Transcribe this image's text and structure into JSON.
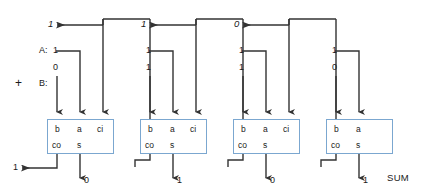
{
  "diagram": {
    "title_label": "SUM",
    "operand_a_label": "A:",
    "operand_b_label": "B:",
    "plus_sign": "+",
    "colors": {
      "box_border": "#7ba7d0",
      "wire": "#333333",
      "text": "#1a1a1a",
      "background": "#ffffff"
    },
    "ports": {
      "b": "b",
      "a": "a",
      "ci": "ci",
      "co": "co",
      "s": "s"
    },
    "carry_out_final": "1",
    "carries": [
      {
        "value": "1"
      },
      {
        "value": "1"
      },
      {
        "value": "0"
      }
    ],
    "adders": [
      {
        "a": "1",
        "b": "0",
        "sum": "0",
        "has_ci": true
      },
      {
        "a": "1",
        "b": "1",
        "sum": "1",
        "has_ci": true
      },
      {
        "a": "1",
        "b": "1",
        "sum": "0",
        "has_ci": true
      },
      {
        "a": "1",
        "b": "0",
        "sum": "1",
        "has_ci": false
      }
    ]
  }
}
